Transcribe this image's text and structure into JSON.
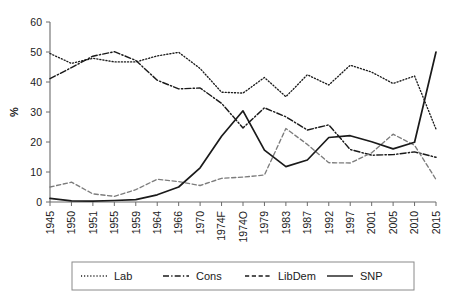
{
  "chart_data": {
    "type": "line",
    "title": "",
    "xlabel": "",
    "ylabel": "%",
    "ylim": [
      0,
      60
    ],
    "yticks": [
      0,
      10,
      20,
      30,
      40,
      50,
      60
    ],
    "grid": false,
    "legend_position": "bottom",
    "categories": [
      "1945",
      "1950",
      "1951",
      "1955",
      "1959",
      "1964",
      "1966",
      "1970",
      "1974F",
      "1974O",
      "1979",
      "1983",
      "1987",
      "1992",
      "1997",
      "2001",
      "2005",
      "2010",
      "2015"
    ],
    "series": [
      {
        "name": "Lab",
        "style": "dotted",
        "color": "#1a1a1a",
        "values": [
          49.5,
          46.2,
          47.9,
          46.7,
          46.7,
          48.7,
          49.9,
          44.5,
          36.6,
          36.3,
          41.5,
          35.1,
          42.4,
          39.0,
          45.6,
          43.3,
          39.5,
          42.0,
          24.3
        ]
      },
      {
        "name": "Cons",
        "style": "dash-dot",
        "color": "#1a1a1a",
        "values": [
          41.1,
          44.8,
          48.6,
          50.1,
          47.2,
          40.6,
          37.7,
          38.0,
          32.9,
          24.7,
          31.4,
          28.4,
          24.0,
          25.7,
          17.5,
          15.6,
          15.8,
          16.7,
          14.9
        ]
      },
      {
        "name": "LibDem",
        "style": "dashed",
        "color": "#7c7c7c",
        "values": [
          5.0,
          6.6,
          2.7,
          1.9,
          4.1,
          7.6,
          6.8,
          5.5,
          7.9,
          8.3,
          9.0,
          24.5,
          19.2,
          13.1,
          13.0,
          16.4,
          22.6,
          18.9,
          7.5
        ]
      },
      {
        "name": "SNP",
        "style": "solid",
        "color": "#1a1a1a",
        "values": [
          1.2,
          0.4,
          0.3,
          0.5,
          0.8,
          2.4,
          5.0,
          11.4,
          21.9,
          30.4,
          17.3,
          11.8,
          14.0,
          21.5,
          22.1,
          20.1,
          17.7,
          19.9,
          50.0
        ]
      }
    ],
    "legend": [
      {
        "label": "Lab",
        "style": "dotted"
      },
      {
        "label": "Cons",
        "style": "dash-dot"
      },
      {
        "label": "LibDem",
        "style": "dashed"
      },
      {
        "label": "SNP",
        "style": "solid"
      }
    ]
  }
}
